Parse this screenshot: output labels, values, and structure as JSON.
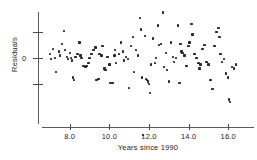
{
  "chart_data": {
    "type": "scatter",
    "title": "",
    "xlabel": "Years since 1990",
    "ylabel": "Residuals",
    "xlim": [
      6.6,
      17.3
    ],
    "ylim": [
      -3.2,
      2.3
    ],
    "grid": false,
    "legend": null,
    "xticks": [
      8.0,
      10.0,
      12.0,
      14.0,
      16.0
    ],
    "xticklabels": [
      "8.0",
      "10.0",
      "12.0",
      "14.0",
      "16.0"
    ],
    "yticks": [
      1.0,
      0.0,
      -1.0
    ],
    "yticklabels": [
      "",
      "0",
      ""
    ],
    "marker": "square",
    "marker_color": "#2b2b2b",
    "axis_color": "#5a5a5a",
    "points": [
      [
        7.0,
        0.15
      ],
      [
        7.05,
        -0.05
      ],
      [
        7.15,
        0.35
      ],
      [
        7.25,
        0.0
      ],
      [
        7.3,
        -0.55
      ],
      [
        7.45,
        0.25
      ],
      [
        7.5,
        0.1
      ],
      [
        7.6,
        0.55
      ],
      [
        7.7,
        1.05
      ],
      [
        7.75,
        0.3
      ],
      [
        7.85,
        0.05
      ],
      [
        7.9,
        -0.05
      ],
      [
        8.0,
        0.2
      ],
      [
        8.05,
        0.0
      ],
      [
        8.1,
        -0.1
      ],
      [
        8.15,
        -0.75
      ],
      [
        8.2,
        -0.85
      ],
      [
        8.3,
        0.05
      ],
      [
        8.4,
        0.15
      ],
      [
        8.5,
        0.6
      ],
      [
        8.55,
        0.1
      ],
      [
        8.6,
        0.0
      ],
      [
        8.7,
        -0.3
      ],
      [
        8.8,
        -0.35
      ],
      [
        8.85,
        -0.3
      ],
      [
        8.95,
        -0.2
      ],
      [
        9.0,
        0.0
      ],
      [
        9.1,
        0.15
      ],
      [
        9.2,
        0.3
      ],
      [
        9.3,
        0.4
      ],
      [
        9.35,
        -0.85
      ],
      [
        9.45,
        -0.8
      ],
      [
        9.5,
        0.15
      ],
      [
        9.6,
        0.1
      ],
      [
        9.65,
        0.45
      ],
      [
        9.75,
        -0.4
      ],
      [
        9.8,
        -0.45
      ],
      [
        9.9,
        0.05
      ],
      [
        10.0,
        -0.25
      ],
      [
        10.05,
        -0.95
      ],
      [
        10.15,
        -0.95
      ],
      [
        10.25,
        0.1
      ],
      [
        10.3,
        0.3
      ],
      [
        10.35,
        -0.2
      ],
      [
        10.5,
        0.15
      ],
      [
        10.6,
        0.6
      ],
      [
        10.7,
        0.25
      ],
      [
        10.75,
        -0.1
      ],
      [
        10.85,
        0.05
      ],
      [
        10.95,
        -0.05
      ],
      [
        11.0,
        -1.15
      ],
      [
        11.1,
        0.45
      ],
      [
        11.2,
        0.8
      ],
      [
        11.25,
        -0.55
      ],
      [
        11.35,
        0.3
      ],
      [
        11.45,
        0.1
      ],
      [
        11.55,
        1.55
      ],
      [
        11.6,
        1.1
      ],
      [
        11.65,
        -0.75
      ],
      [
        11.7,
        -2.95
      ],
      [
        11.8,
        0.85
      ],
      [
        11.85,
        -0.8
      ],
      [
        11.9,
        -0.85
      ],
      [
        11.95,
        -0.9
      ],
      [
        12.0,
        -1.0
      ],
      [
        12.05,
        -1.35
      ],
      [
        12.1,
        -0.25
      ],
      [
        12.2,
        0.75
      ],
      [
        12.3,
        -0.2
      ],
      [
        12.35,
        0.0
      ],
      [
        12.45,
        1.25
      ],
      [
        12.5,
        0.5
      ],
      [
        12.6,
        0.55
      ],
      [
        12.7,
        1.75
      ],
      [
        12.75,
        -0.35
      ],
      [
        12.85,
        0.2
      ],
      [
        12.9,
        -0.45
      ],
      [
        13.0,
        -0.9
      ],
      [
        13.1,
        0.6
      ],
      [
        13.2,
        0.05
      ],
      [
        13.25,
        -0.15
      ],
      [
        13.35,
        0.0
      ],
      [
        13.45,
        1.25
      ],
      [
        13.5,
        -0.95
      ],
      [
        13.55,
        -0.95
      ],
      [
        13.6,
        0.55
      ],
      [
        13.65,
        0.25
      ],
      [
        13.7,
        0.2
      ],
      [
        13.8,
        0.1
      ],
      [
        13.9,
        -0.3
      ],
      [
        14.0,
        0.45
      ],
      [
        14.05,
        0.6
      ],
      [
        14.15,
        1.3
      ],
      [
        14.2,
        0.9
      ],
      [
        14.3,
        0.15
      ],
      [
        14.4,
        0.0
      ],
      [
        14.5,
        -0.2
      ],
      [
        14.55,
        -0.4
      ],
      [
        14.6,
        -0.25
      ],
      [
        14.7,
        0.35
      ],
      [
        14.8,
        0.5
      ],
      [
        14.9,
        -0.15
      ],
      [
        15.0,
        -0.25
      ],
      [
        15.1,
        -0.85
      ],
      [
        15.2,
        -1.2
      ],
      [
        15.3,
        0.45
      ],
      [
        15.4,
        1.0
      ],
      [
        15.5,
        1.15
      ],
      [
        15.55,
        0.8
      ],
      [
        15.6,
        0.15
      ],
      [
        15.7,
        -0.15
      ],
      [
        15.8,
        -0.05
      ],
      [
        15.9,
        -0.6
      ],
      [
        16.0,
        -0.75
      ],
      [
        16.05,
        -1.6
      ],
      [
        16.1,
        -1.7
      ],
      [
        16.2,
        -0.35
      ],
      [
        16.3,
        -0.4
      ],
      [
        16.4,
        -0.25
      ]
    ]
  },
  "axes": {
    "ylabel": "Residuals",
    "xlabel": "Years since 1990",
    "y_zero_label": "0",
    "xtick_labels": [
      "8.0",
      "10.0",
      "12.0",
      "14.0",
      "16.0"
    ]
  }
}
